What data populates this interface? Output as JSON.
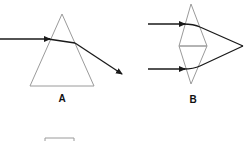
{
  "figure": {
    "panels": [
      {
        "id": "A",
        "label": "A",
        "shape": "triangular-prism",
        "description": "single beam refracted through a prism"
      },
      {
        "id": "B",
        "label": "B",
        "shape": "double-prism",
        "description": "two parallel beams converge after passing through two base-to-base prisms"
      }
    ],
    "colors": {
      "prism_outline": "#9a9a9a",
      "beam": "#1a1a1a",
      "label": "#111111"
    }
  }
}
